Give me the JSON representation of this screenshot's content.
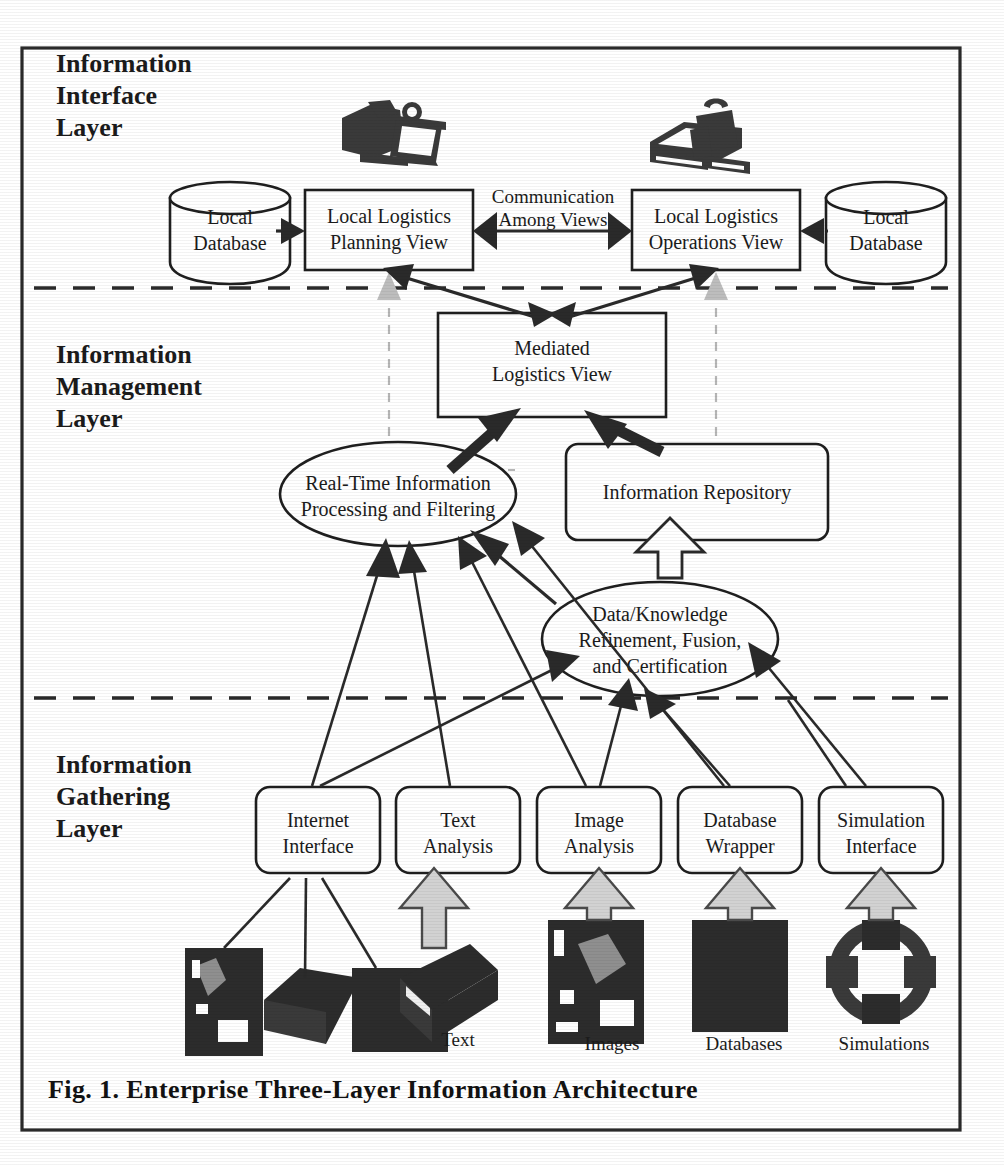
{
  "figure": {
    "caption": "Fig. 1.  Enterprise Three-Layer Information Architecture"
  },
  "layers": [
    {
      "id": "interface",
      "label_lines": [
        "Information",
        "Interface",
        "Layer"
      ]
    },
    {
      "id": "management",
      "label_lines": [
        "Information",
        "Management",
        "Layer"
      ]
    },
    {
      "id": "gathering",
      "label_lines": [
        "Information",
        "Gathering",
        "Layer"
      ]
    }
  ],
  "interface_layer": {
    "left_database": {
      "lines": [
        "Local",
        "Database"
      ]
    },
    "right_database": {
      "lines": [
        "Local",
        "Database"
      ]
    },
    "planning_view": {
      "lines": [
        "Local Logistics",
        "Planning View"
      ]
    },
    "operations_view": {
      "lines": [
        "Local Logistics",
        "Operations View"
      ]
    },
    "communication_label": {
      "lines": [
        "Communication",
        "Among Views"
      ]
    },
    "icons": [
      "workstation-icon",
      "workstation-icon"
    ]
  },
  "management_layer": {
    "mediated_view": {
      "lines": [
        "Mediated",
        "Logistics View"
      ]
    },
    "realtime_ellipse": {
      "lines": [
        "Real-Time Information",
        "Processing and Filtering"
      ]
    },
    "repository": {
      "lines": [
        "Information Repository"
      ]
    },
    "fusion_ellipse": {
      "lines": [
        "Data/Knowledge",
        "Refinement, Fusion,",
        "and Certification"
      ]
    }
  },
  "gathering_layer": {
    "nodes": [
      {
        "lines": [
          "Internet",
          "Interface"
        ]
      },
      {
        "lines": [
          "Text",
          "Analysis"
        ]
      },
      {
        "lines": [
          "Image",
          "Analysis"
        ]
      },
      {
        "lines": [
          "Database",
          "Wrapper"
        ]
      },
      {
        "lines": [
          "Simulation",
          "Interface"
        ]
      }
    ],
    "source_labels": [
      "Text",
      "Images",
      "Databases",
      "Simulations"
    ],
    "source_icons": [
      "web-page-icon",
      "web-page-icon",
      "web-page-icon",
      "book-icon",
      "image-icon",
      "database-block-icon",
      "simulation-gear-icon"
    ]
  },
  "colors": {
    "ink": "#1f1f1f",
    "flow": "#2a2a2a",
    "ghost": "#b6b6b6",
    "paper": "#ffffff",
    "clipart": "#3a3a3a",
    "gray_arrow": "#d2d2d2"
  }
}
